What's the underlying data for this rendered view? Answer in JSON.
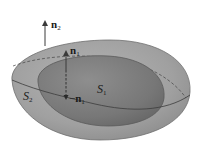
{
  "figure": {
    "type": "surface-normals-diagram",
    "colors": {
      "background": "#ffffff",
      "outer_surface_fill": "#a3a3a3",
      "outer_surface_edge": "#6e6e6e",
      "inner_surface_fill": "#7d7d7d",
      "inner_surface_edge": "#5a5a5a",
      "dashed_curve": "#3c3c3c",
      "vector_color": "#3a3a3a"
    },
    "surfaces": [
      {
        "id": "S2",
        "label_base": "S",
        "label_sub": "2",
        "role": "outer surface"
      },
      {
        "id": "S1",
        "label_base": "S",
        "label_sub": "1",
        "role": "inner surface"
      }
    ],
    "vectors": [
      {
        "id": "n2",
        "prefix": "",
        "label_base": "n",
        "label_sub": "2",
        "direction": "up",
        "style": "solid"
      },
      {
        "id": "n1",
        "prefix": "",
        "label_base": "n",
        "label_sub": "1",
        "direction": "up",
        "style": "solid"
      },
      {
        "id": "neg_n1",
        "prefix": "−",
        "label_base": "n",
        "label_sub": "1",
        "direction": "down",
        "style": "dashed"
      }
    ]
  }
}
